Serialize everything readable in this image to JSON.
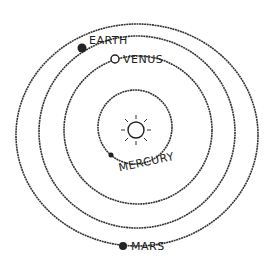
{
  "center": {
    "name": "Sun",
    "icon": "sun-icon"
  },
  "planets": [
    {
      "name": "MERCURY",
      "order": 1
    },
    {
      "name": "VENUS",
      "order": 2
    },
    {
      "name": "EARTH",
      "order": 3
    },
    {
      "name": "MARS",
      "order": 4
    }
  ],
  "colors": {
    "ink": "#333333",
    "background": "#ffffff"
  }
}
